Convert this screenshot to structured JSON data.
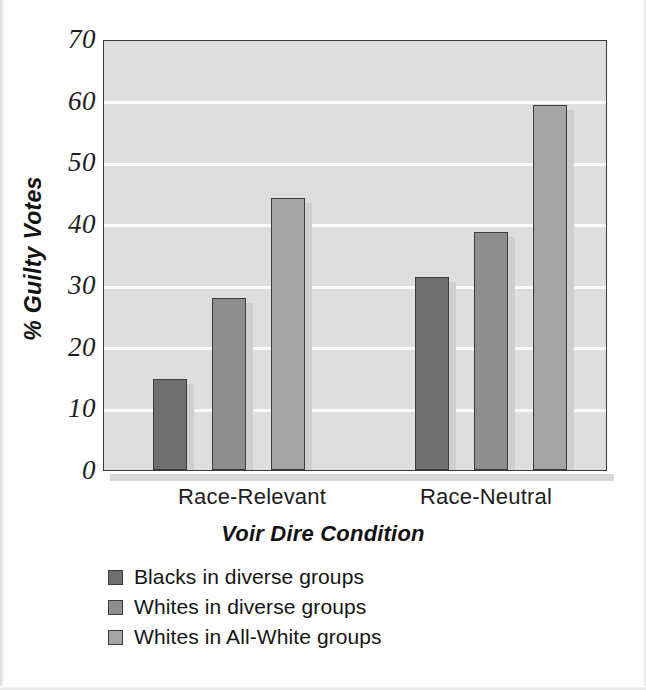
{
  "chart_data": {
    "type": "bar",
    "title": "",
    "xlabel": "Voir Dire Condition",
    "ylabel": "% Guilty Votes",
    "categories": [
      "Race-Relevant",
      "Race-Neutral"
    ],
    "ylim": [
      0,
      70
    ],
    "yticks": [
      "0",
      "10",
      "20",
      "30",
      "40",
      "50",
      "60",
      "70"
    ],
    "ytick_values": [
      0,
      10,
      20,
      30,
      40,
      50,
      60,
      70
    ],
    "grid": true,
    "legend_position": "below-left",
    "series": [
      {
        "name": "Blacks in diverse groups",
        "color": "#6f6f6f",
        "values": [
          14.8,
          31.3
        ]
      },
      {
        "name": "Whites in diverse groups",
        "color": "#8e8e8e",
        "values": [
          28.0,
          38.6
        ]
      },
      {
        "name": "Whites in All-White groups",
        "color": "#a5a5a5",
        "values": [
          44.1,
          59.3
        ]
      }
    ],
    "plot_background": "#dedede",
    "gridline_color": "#fbfbfb",
    "axis_color": "#3a3a3a"
  }
}
